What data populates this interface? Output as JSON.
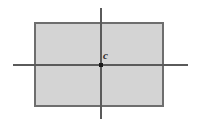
{
  "figure": {
    "name": "rectangle-with-center-and-axes",
    "canvas": {
      "width": 199,
      "height": 125,
      "background_color": "#ffffff"
    },
    "labels": {
      "center_point_label": "c"
    },
    "colors": {
      "rectangle_fill": "#d4d4d4",
      "rectangle_stroke": "#6e6e6e",
      "axis_line": "#5a5a5a",
      "center_dot": "#1a1a1a",
      "label_text": "#2b2b2b"
    },
    "geometry": {
      "rectangle": {
        "x": 34,
        "y": 22,
        "width": 130,
        "height": 85,
        "stroke_width": 2
      },
      "horizontal_axis": {
        "x1": 13,
        "y1": 65,
        "x2": 188,
        "y2": 65,
        "stroke_width": 2
      },
      "vertical_axis": {
        "x1": 101,
        "y1": 8,
        "x2": 101,
        "y2": 119,
        "stroke_width": 2
      },
      "center_point": {
        "cx": 101,
        "cy": 65,
        "size": 4
      },
      "label_position": {
        "x": 103,
        "y": 50
      }
    }
  }
}
